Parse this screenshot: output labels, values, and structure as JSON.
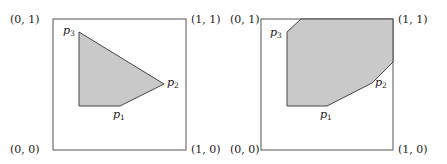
{
  "colors": {
    "fill": "#c9c9c9",
    "stroke": "#444444",
    "box": "#555555"
  },
  "corner_labels": {
    "top_left": "(0, 1)",
    "top_right": "(1, 1)",
    "bottom_left": "(0, 0)",
    "bottom_right": "(1, 0)"
  },
  "point_labels": {
    "p1": "p",
    "p1_sub": "1",
    "p2": "p",
    "p2_sub": "2",
    "p3": "p",
    "p3_sub": "3"
  },
  "panels": [
    {
      "name": "convex-hull",
      "box": [
        53,
        19,
        186,
        150
      ],
      "polygon": "79,32 164,84 120,106 79,106"
    },
    {
      "name": "dominated-region",
      "box": [
        261,
        19,
        393,
        150
      ],
      "polygon": "287,106 327,106 372,83 393,62 393,19 301,19 287,32"
    }
  ]
}
